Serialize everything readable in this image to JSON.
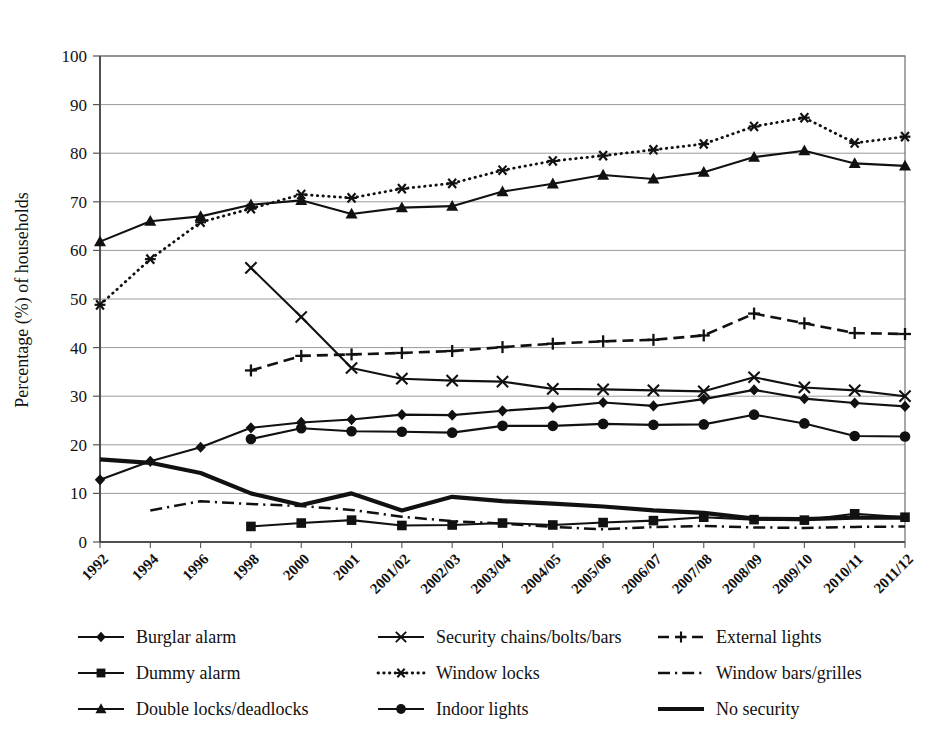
{
  "chart_data": {
    "type": "line",
    "title": "",
    "xlabel": "",
    "ylabel": "Percentage (%) of households",
    "ylim": [
      0,
      100
    ],
    "ytick_step": 10,
    "yticks": [
      0,
      10,
      20,
      30,
      40,
      50,
      60,
      70,
      80,
      90,
      100
    ],
    "grid": true,
    "legend_position": "bottom",
    "legend_columns": 3,
    "categories": [
      "1992",
      "1994",
      "1996",
      "1998",
      "2000",
      "2001",
      "2001/02",
      "2002/03",
      "2003/04",
      "2004/05",
      "2005/06",
      "2006/07",
      "2007/08",
      "2008/09",
      "2009/10",
      "2010/11",
      "2011/12"
    ],
    "series": [
      {
        "name": "Burglar alarm",
        "marker": "diamond",
        "line": "solid",
        "values": [
          12.8,
          16.6,
          19.5,
          23.5,
          24.6,
          25.2,
          26.2,
          26.1,
          27.0,
          27.7,
          28.7,
          28.0,
          29.4,
          31.3,
          29.5,
          28.6,
          27.9
        ]
      },
      {
        "name": "Dummy alarm",
        "marker": "square",
        "line": "solid",
        "values": [
          null,
          null,
          null,
          3.2,
          3.9,
          4.5,
          3.4,
          3.5,
          3.9,
          3.5,
          4.0,
          4.4,
          5.1,
          4.6,
          4.5,
          5.8,
          5.1
        ]
      },
      {
        "name": "Double locks/deadlocks",
        "marker": "triangle",
        "line": "solid",
        "values": [
          61.8,
          66.0,
          67.0,
          69.4,
          70.3,
          67.5,
          68.8,
          69.1,
          72.1,
          73.7,
          75.5,
          74.7,
          76.1,
          79.2,
          80.5,
          77.9,
          77.4
        ]
      },
      {
        "name": "Security chains/bolts/bars",
        "marker": "cross-x",
        "line": "solid",
        "values": [
          null,
          null,
          null,
          56.4,
          46.3,
          35.8,
          33.6,
          33.2,
          33.0,
          31.5,
          31.4,
          31.2,
          31.0,
          33.9,
          31.8,
          31.2,
          30.0
        ]
      },
      {
        "name": "Window locks",
        "marker": "asterisk",
        "line": "dotted",
        "values": [
          48.8,
          58.2,
          65.8,
          68.6,
          71.5,
          70.8,
          72.7,
          73.8,
          76.5,
          78.4,
          79.5,
          80.7,
          81.9,
          85.5,
          87.3,
          82.1,
          83.4
        ]
      },
      {
        "name": "Indoor lights",
        "marker": "circle",
        "line": "solid",
        "values": [
          null,
          null,
          null,
          21.2,
          23.4,
          22.8,
          22.7,
          22.5,
          23.9,
          23.9,
          24.3,
          24.1,
          24.2,
          26.2,
          24.4,
          21.8,
          21.7
        ]
      },
      {
        "name": "External lights",
        "marker": "plus",
        "line": "dashed",
        "values": [
          null,
          null,
          null,
          35.3,
          38.3,
          38.6,
          38.9,
          39.3,
          40.1,
          40.8,
          41.3,
          41.6,
          42.5,
          47.0,
          45.0,
          43.0,
          42.8
        ]
      },
      {
        "name": "Window bars/grilles",
        "marker": "none",
        "line": "dash-dot",
        "values": [
          null,
          6.5,
          8.4,
          7.8,
          7.4,
          6.6,
          5.2,
          4.3,
          3.8,
          3.1,
          2.6,
          3.1,
          3.3,
          3.0,
          2.9,
          3.1,
          3.2
        ]
      },
      {
        "name": "No security",
        "marker": "none",
        "line": "thick-solid",
        "values": [
          17.0,
          16.3,
          14.2,
          10.0,
          7.6,
          10.0,
          6.5,
          9.3,
          8.4,
          7.9,
          7.3,
          6.5,
          6.0,
          4.8,
          4.7,
          5.0,
          5.0
        ]
      }
    ]
  },
  "legend": {
    "items": [
      {
        "label": "Burglar alarm",
        "key": "burglar-alarm"
      },
      {
        "label": "Security chains/bolts/bars",
        "key": "security-chains"
      },
      {
        "label": "External lights",
        "key": "external-lights"
      },
      {
        "label": "Dummy alarm",
        "key": "dummy-alarm"
      },
      {
        "label": "Window locks",
        "key": "window-locks"
      },
      {
        "label": "Window bars/grilles",
        "key": "window-bars"
      },
      {
        "label": "Double locks/deadlocks",
        "key": "double-locks"
      },
      {
        "label": "Indoor lights",
        "key": "indoor-lights"
      },
      {
        "label": "No security",
        "key": "no-security"
      }
    ]
  },
  "colors": {
    "ink": "#111111",
    "grid": "#9a9a9a",
    "frame": "#6f6f6f",
    "background": "#ffffff"
  }
}
